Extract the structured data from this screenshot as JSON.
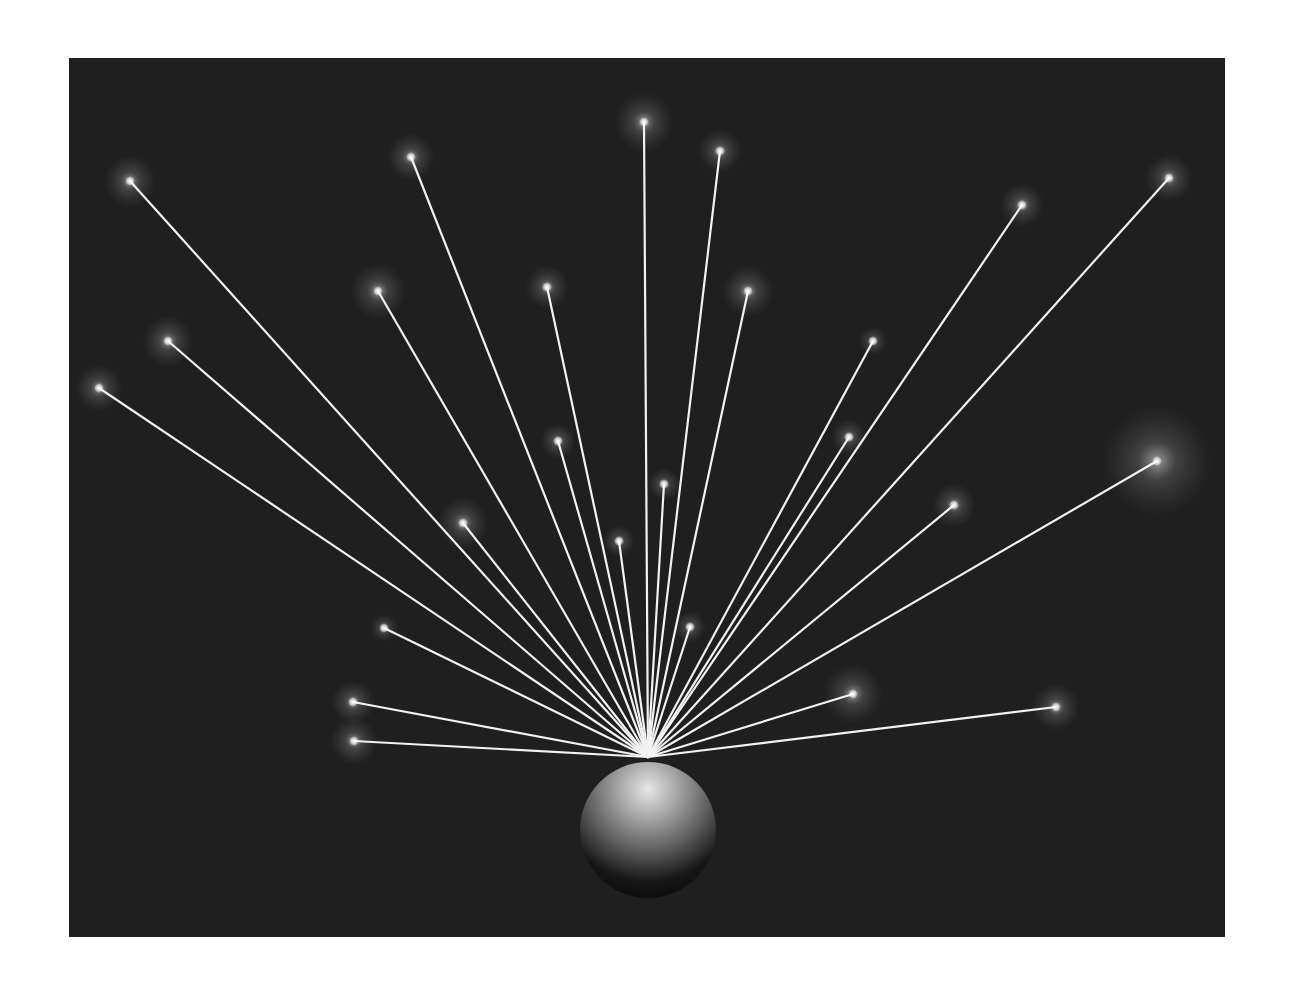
{
  "image": {
    "description": "Glowing points of light connected by rays to a shaded sphere on a dark background",
    "background_color": "#1f1f1f",
    "page_color": "#ffffff",
    "ray_color": "#f2f2f2",
    "panel": {
      "x": 69,
      "y": 58,
      "width": 1156,
      "height": 879
    },
    "sphere": {
      "cx": 648,
      "cy": 830,
      "r": 68
    },
    "origin": {
      "x": 648,
      "y": 757
    },
    "stars": [
      {
        "x": 130,
        "y": 181,
        "glow": 26
      },
      {
        "x": 411,
        "y": 157,
        "glow": 24
      },
      {
        "x": 644,
        "y": 122,
        "glow": 30
      },
      {
        "x": 720,
        "y": 151,
        "glow": 22
      },
      {
        "x": 1022,
        "y": 205,
        "glow": 22
      },
      {
        "x": 1169,
        "y": 178,
        "glow": 24
      },
      {
        "x": 168,
        "y": 341,
        "glow": 26
      },
      {
        "x": 99,
        "y": 388,
        "glow": 24
      },
      {
        "x": 378,
        "y": 291,
        "glow": 28
      },
      {
        "x": 547,
        "y": 287,
        "glow": 22
      },
      {
        "x": 748,
        "y": 291,
        "glow": 26
      },
      {
        "x": 873,
        "y": 341,
        "glow": 14
      },
      {
        "x": 558,
        "y": 441,
        "glow": 18
      },
      {
        "x": 849,
        "y": 437,
        "glow": 18
      },
      {
        "x": 1157,
        "y": 461,
        "glow": 55
      },
      {
        "x": 954,
        "y": 505,
        "glow": 22
      },
      {
        "x": 664,
        "y": 484,
        "glow": 16
      },
      {
        "x": 463,
        "y": 523,
        "glow": 26
      },
      {
        "x": 619,
        "y": 541,
        "glow": 16
      },
      {
        "x": 690,
        "y": 627,
        "glow": 16
      },
      {
        "x": 384,
        "y": 628,
        "glow": 14
      },
      {
        "x": 353,
        "y": 702,
        "glow": 22
      },
      {
        "x": 354,
        "y": 741,
        "glow": 24
      },
      {
        "x": 853,
        "y": 694,
        "glow": 30
      },
      {
        "x": 1056,
        "y": 707,
        "glow": 24
      }
    ]
  }
}
